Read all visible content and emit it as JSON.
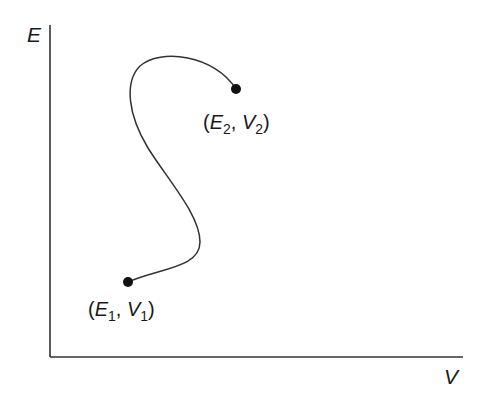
{
  "diagram": {
    "axes": {
      "y_label": "E",
      "x_label": "V"
    },
    "points": [
      {
        "id": "p1",
        "label_open": "(",
        "var1": "E",
        "sub1": "1",
        "sep": ", ",
        "var2": "V",
        "sub2": "1",
        "label_close": ")",
        "x": 128,
        "y": 282
      },
      {
        "id": "p2",
        "label_open": "(",
        "var1": "E",
        "sub1": "2",
        "sep": ", ",
        "var2": "V",
        "sub2": "2",
        "label_close": ")",
        "x": 236,
        "y": 89
      }
    ],
    "curve": {
      "description": "S-shaped path from (E1, V1) to (E2, V2)",
      "color": "#333333"
    },
    "colors": {
      "axis": "#333333",
      "point": "#111111",
      "background": "#ffffff"
    }
  }
}
